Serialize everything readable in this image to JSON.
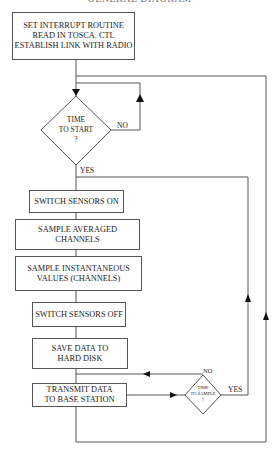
{
  "title": "GENERAL DIAGRAM",
  "nodes": {
    "init": [
      "SET INTERRUPT ROUTINE",
      "READ IN TOSCA. CTL",
      "ESTABLISH LINK WITH RADIO"
    ],
    "time_to_start": [
      "TIME",
      "TO START",
      "?"
    ],
    "sensors_on": [
      "SWITCH SENSORS ON"
    ],
    "sample_avg": [
      "SAMPLE  AVERAGED",
      "CHANNELS"
    ],
    "sample_inst": [
      "SAMPLE INSTANTANEOUS",
      "VALUES (CHANNELS)"
    ],
    "sensors_off": [
      "SWITCH SENSORS OFF"
    ],
    "save": [
      "SAVE DATA TO",
      "HARD DISK"
    ],
    "transmit": [
      "TRANSMIT DATA",
      "TO BASE STATION"
    ],
    "time_to_sample": [
      "TIME",
      "TO SAMPLE",
      "?"
    ]
  },
  "labels": {
    "start_no": "NO",
    "start_yes": "YES",
    "sample_no": "NO",
    "sample_yes": "YES"
  },
  "colors": {
    "line": "#555555",
    "arrow": "#111111"
  }
}
